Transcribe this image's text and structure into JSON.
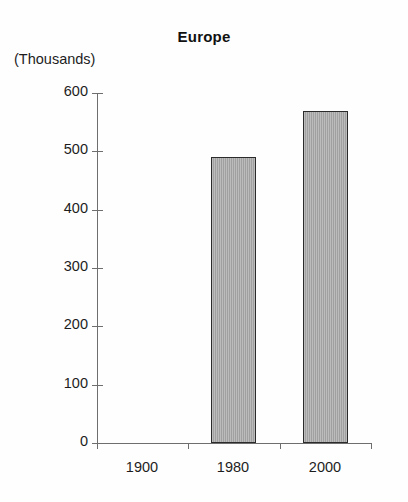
{
  "chart_data": {
    "type": "bar",
    "title": "Europe",
    "xlabel": "",
    "ylabel": "(Thousands)",
    "categories": [
      "1900",
      "1980",
      "2000"
    ],
    "values": [
      null,
      490,
      570
    ],
    "series": [
      {
        "name": "Europe",
        "values": [
          null,
          490,
          570
        ]
      }
    ],
    "ylim": [
      0,
      600
    ],
    "ytick_labels": [
      "0",
      "100",
      "200",
      "300",
      "400",
      "500",
      "600"
    ],
    "ytick_values": [
      0,
      100,
      200,
      300,
      400,
      500,
      600
    ],
    "grid": false,
    "legend": false,
    "legend_position": "none",
    "bar_fill_color": "#a9a9a9",
    "bar_border_color": "#2b2b2b",
    "axis_color": "#6e6e6e",
    "text_color": "#1d1d1d",
    "background_color": "#ffffff"
  }
}
